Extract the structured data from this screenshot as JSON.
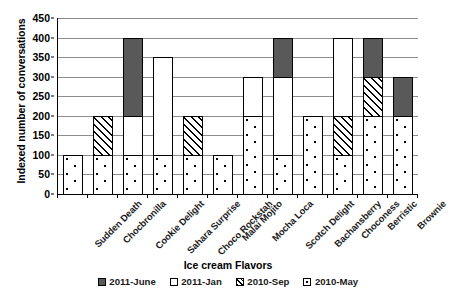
{
  "chart_data": {
    "type": "bar",
    "subtype": "stacked",
    "title": "",
    "xlabel": "Ice cream Flavors",
    "ylabel": "Indexed number of conversations",
    "ylim": [
      0,
      450
    ],
    "ytick_step": 50,
    "yticks": [
      450,
      400,
      350,
      300,
      250,
      200,
      150,
      100,
      50,
      0
    ],
    "grid": true,
    "legend_position": "bottom",
    "categories": [
      "Sudden Death",
      "Chocbronilla",
      "Cookie Delight",
      "Sahara Surprise",
      "Choco Rockstah",
      "Malai Mojito",
      "Mocha Loca",
      "Scotch Delight",
      "Bachansberry",
      "Choconess",
      "Berristic",
      "Brownie"
    ],
    "series": [
      {
        "name": "2010-May",
        "pattern": "dotted",
        "values": [
          100,
          100,
          100,
          100,
          100,
          100,
          200,
          100,
          200,
          100,
          200,
          200
        ]
      },
      {
        "name": "2010-Sep",
        "pattern": "hatched",
        "values": [
          0,
          100,
          0,
          0,
          100,
          0,
          0,
          0,
          0,
          100,
          100,
          0
        ]
      },
      {
        "name": "2011-Jan",
        "pattern": "white",
        "values": [
          0,
          0,
          100,
          250,
          0,
          0,
          100,
          200,
          0,
          200,
          0,
          0
        ]
      },
      {
        "name": "2011-June",
        "pattern": "dark",
        "values": [
          0,
          0,
          200,
          0,
          0,
          0,
          0,
          100,
          0,
          0,
          100,
          100
        ]
      }
    ],
    "totals": [
      100,
      200,
      400,
      350,
      200,
      100,
      300,
      400,
      200,
      400,
      400,
      300
    ]
  },
  "legend": {
    "items": [
      {
        "label": "2011-June",
        "key": "s-2011-june"
      },
      {
        "label": "2011-Jan",
        "key": "s-2011-jan"
      },
      {
        "label": "2010-Sep",
        "key": "s-2010-sep"
      },
      {
        "label": "2010-May",
        "key": "s-2010-may"
      }
    ]
  },
  "colors": {
    "dark_fill": "#595959",
    "white_fill": "#ffffff",
    "outline": "#000000",
    "gridline": "#8d8d8d"
  }
}
